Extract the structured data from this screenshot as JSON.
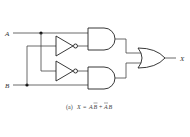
{
  "diagram": {
    "type": "logic-circuit",
    "inputs": [
      "A",
      "B"
    ],
    "output": "X",
    "gates": [
      {
        "id": "not1",
        "type": "NOT",
        "input": "B"
      },
      {
        "id": "not2",
        "type": "NOT",
        "input": "A"
      },
      {
        "id": "and1",
        "type": "AND",
        "inputs": [
          "A",
          "NOT B"
        ]
      },
      {
        "id": "and2",
        "type": "AND",
        "inputs": [
          "NOT A",
          "B"
        ]
      },
      {
        "id": "or1",
        "type": "OR",
        "inputs": [
          "and1",
          "and2"
        ],
        "output": "X"
      }
    ],
    "labels": {
      "input_a": "A",
      "input_b": "B",
      "output_x": "X",
      "caption_prefix": "(a)",
      "caption_lhs": "X",
      "caption_eq": "=",
      "caption_t1a": "A",
      "caption_t1b": "B",
      "caption_plus": "+",
      "caption_t2a": "A",
      "caption_t2b": "B"
    },
    "caption": "(a) X = AB̄ + ĀB"
  }
}
